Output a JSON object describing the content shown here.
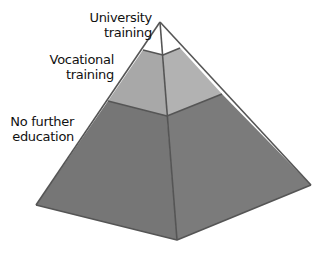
{
  "diagram": {
    "type": "pyramid",
    "levels": [
      {
        "id": "university",
        "label_line1": "University",
        "label_line2": "training",
        "fill_left": "#ffffff",
        "fill_right": "#ffffff"
      },
      {
        "id": "vocational",
        "label_line1": "Vocational",
        "label_line2": "training",
        "fill_left": "#a8a8a8",
        "fill_right": "#b2b2b2"
      },
      {
        "id": "no-further",
        "label_line1": "No further",
        "label_line2": "education",
        "fill_left": "#767676",
        "fill_right": "#7b7b7b"
      }
    ],
    "edge_color": "#555555"
  }
}
